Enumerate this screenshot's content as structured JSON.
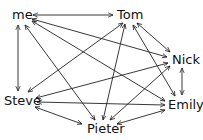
{
  "diagram": {
    "type": "directed-graph",
    "nodes": [
      {
        "id": "me",
        "label": "me",
        "x": 20,
        "y": 15
      },
      {
        "id": "tom",
        "label": "Tom",
        "x": 128,
        "y": 15
      },
      {
        "id": "nick",
        "label": "Nick",
        "x": 184,
        "y": 60
      },
      {
        "id": "steve",
        "label": "Steve",
        "x": 20,
        "y": 100
      },
      {
        "id": "emily",
        "label": "Emily",
        "x": 184,
        "y": 105
      },
      {
        "id": "pieter",
        "label": "Pieter",
        "x": 106,
        "y": 128
      }
    ],
    "edges": [
      {
        "from": "me",
        "to": "tom",
        "bidirectional": true
      },
      {
        "from": "me",
        "to": "nick",
        "bidirectional": true
      },
      {
        "from": "me",
        "to": "emily",
        "bidirectional": true
      },
      {
        "from": "me",
        "to": "steve",
        "bidirectional": true
      },
      {
        "from": "me",
        "to": "pieter",
        "bidirectional": true
      },
      {
        "from": "tom",
        "to": "nick",
        "bidirectional": true
      },
      {
        "from": "tom",
        "to": "emily",
        "bidirectional": true
      },
      {
        "from": "tom",
        "to": "steve",
        "bidirectional": true
      },
      {
        "from": "tom",
        "to": "pieter",
        "bidirectional": true
      },
      {
        "from": "nick",
        "to": "emily",
        "bidirectional": true
      },
      {
        "from": "nick",
        "to": "steve",
        "bidirectional": true
      },
      {
        "from": "nick",
        "to": "pieter",
        "bidirectional": true
      },
      {
        "from": "steve",
        "to": "emily",
        "bidirectional": true
      },
      {
        "from": "steve",
        "to": "pieter",
        "bidirectional": true
      },
      {
        "from": "pieter",
        "to": "emily",
        "bidirectional": true
      }
    ],
    "colors": {
      "edge": "#222222",
      "text": "#111111",
      "background": "#ffffff"
    }
  }
}
